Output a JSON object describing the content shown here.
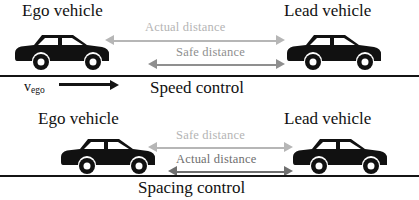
{
  "figure": {
    "panels": [
      {
        "id": "speed-control",
        "mode_label": "Speed control",
        "ego_label": "Ego vehicle",
        "lead_label": "Lead vehicle",
        "velocity_label": "v",
        "velocity_subscript": "ego",
        "distances": [
          {
            "id": "actual",
            "label": "Actual distance",
            "color": "#b6b6b6",
            "relative_length": "long"
          },
          {
            "id": "safe",
            "label": "Safe distance",
            "color": "#8f8f8f",
            "relative_length": "short"
          }
        ]
      },
      {
        "id": "spacing-control",
        "mode_label": "Spacing control",
        "ego_label": "Ego vehicle",
        "lead_label": "Lead vehicle",
        "distances": [
          {
            "id": "safe",
            "label": "Safe distance",
            "color": "#b6b6b6",
            "relative_length": "long"
          },
          {
            "id": "actual",
            "label": "Actual distance",
            "color": "#6f6f6f",
            "relative_length": "short"
          }
        ]
      }
    ],
    "colors": {
      "road": "#141414",
      "vehicle": "#111111",
      "text": "#111111",
      "arrow_light": "#b6b6b6",
      "arrow_mid": "#8f8f8f",
      "arrow_dark": "#6f6f6f"
    },
    "icons": {
      "vehicle": "car-side-silhouette-icon",
      "road": "road-line-icon",
      "double_arrow": "double-headed-arrow-icon",
      "velocity_arrow": "right-arrow-icon"
    }
  }
}
